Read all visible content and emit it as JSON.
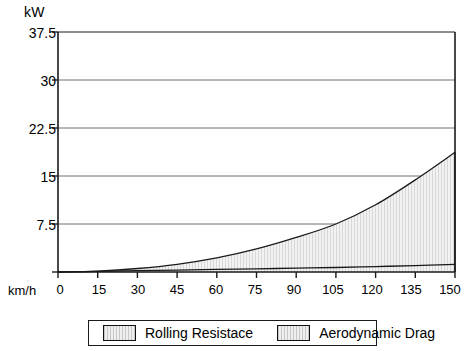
{
  "axes": {
    "y_unit_label": "kW",
    "x_unit_label": "km/h",
    "y_ticks": [
      "0",
      "7.5",
      "15",
      "22.5",
      "30",
      "37.5"
    ],
    "x_ticks": [
      "0",
      "15",
      "30",
      "45",
      "60",
      "75",
      "90",
      "105",
      "120",
      "135",
      "150"
    ]
  },
  "legend": {
    "items": [
      {
        "label": "Rolling Resistace",
        "swatch": "light-gray-hatch"
      },
      {
        "label": "Aerodynamic Drag",
        "swatch": "light-gray-hatch"
      }
    ]
  },
  "colors": {
    "frame": "#1a1a1a",
    "gridline": "#6e6e6e",
    "curve": "#1a1a1a",
    "fill": "#f0f0f0",
    "background": "#ffffff"
  },
  "chart_data": {
    "type": "area",
    "title": "",
    "xlabel": "km/h",
    "ylabel": "kW",
    "xlim": [
      0,
      150
    ],
    "ylim": [
      0,
      37.5
    ],
    "grid": true,
    "legend_position": "bottom",
    "x": [
      0,
      15,
      30,
      45,
      60,
      75,
      90,
      105,
      120,
      135,
      150
    ],
    "series": [
      {
        "name": "Rolling Resistace",
        "values": [
          0,
          0.1,
          0.2,
          0.3,
          0.4,
          0.5,
          0.6,
          0.7,
          0.85,
          1.0,
          1.2
        ]
      },
      {
        "name": "Aerodynamic Drag",
        "values": [
          0,
          0.15,
          0.55,
          1.2,
          2.2,
          3.6,
          5.4,
          7.5,
          10.5,
          14.4,
          18.7
        ]
      }
    ]
  }
}
